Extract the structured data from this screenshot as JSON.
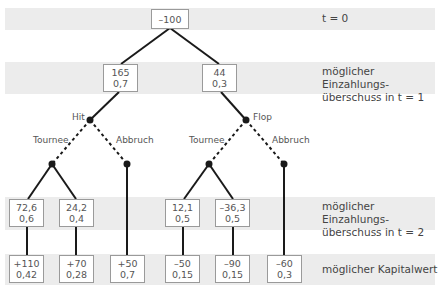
{
  "diagram": {
    "type": "decision-tree",
    "root": {
      "value": "–100"
    },
    "level1": [
      {
        "value": "165",
        "prob": "0,7"
      },
      {
        "value": "44",
        "prob": "0,3"
      }
    ],
    "branch_labels": {
      "hit": "Hit",
      "flop": "Flop",
      "tournee_left": "Tournee",
      "abbruch_left": "Abbruch",
      "tournee_right": "Tournee",
      "abbruch_right": "Abbruch"
    },
    "level2": [
      {
        "value": "72,6",
        "prob": "0,6"
      },
      {
        "value": "24,2",
        "prob": "0,4"
      },
      {
        "value": "12,1",
        "prob": "0,5"
      },
      {
        "value": "–36,3",
        "prob": "0,5"
      }
    ],
    "outcomes": [
      {
        "value": "+110",
        "prob": "0,42"
      },
      {
        "value": "+70",
        "prob": "0,28"
      },
      {
        "value": "+50",
        "prob": "0,7"
      },
      {
        "value": "–50",
        "prob": "0,15"
      },
      {
        "value": "–90",
        "prob": "0,15"
      },
      {
        "value": "–60",
        "prob": "0,3"
      }
    ],
    "row_labels": {
      "t0": "t = 0",
      "t1_line1": "möglicher Einzahlungs-",
      "t1_line2": "überschuss in t = 1",
      "t2_line1": "möglicher Einzahlungs-",
      "t2_line2": "überschuss in t = 2",
      "npv": "möglicher Kapitalwert"
    },
    "colors": {
      "band": "#ececec",
      "line": "#1a1a1a",
      "box_border": "#9a9a9a",
      "text": "#4a4a4a"
    }
  }
}
